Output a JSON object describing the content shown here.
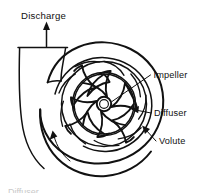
{
  "figure": {
    "type": "centrifugal-pump-cross-section",
    "background_color": "#ffffff",
    "ink_color": "#111111",
    "labels": {
      "discharge": "Discharge",
      "impeller": "Impeller",
      "diffuser": "Diffuser",
      "volute": "Volute"
    },
    "annotations": {
      "discharge_arrow": "up-arrow",
      "rotation_arrow": "counter-clockwise-curved-arrow",
      "leader_impeller": "line-from-text-to-impeller-blades",
      "leader_diffuser": "arrow-from-text-to-diffuser-ring",
      "leader_volute": "arrow-from-text-to-volute-casing"
    },
    "components": {
      "impeller_blade_count": 8,
      "diffuser_vane_count": 9,
      "hub": "small-center-circle",
      "volute": "outer-spiral-casing",
      "discharge_pipe": "tapered-throat-curving-down-left"
    },
    "caption_partial": "Diffuser"
  }
}
